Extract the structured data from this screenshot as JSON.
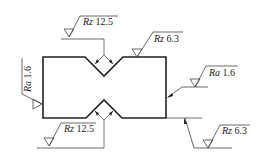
{
  "figure": {
    "type": "surface roughness drawing",
    "symbols": [
      {
        "id": "top-left",
        "param": "Rz",
        "value": "12.5"
      },
      {
        "id": "top-right",
        "param": "Rz",
        "value": "6.3"
      },
      {
        "id": "right-side",
        "param": "Ra",
        "value": "1.6"
      },
      {
        "id": "left-side",
        "param": "Ra",
        "value": "1.6"
      },
      {
        "id": "bottom-left",
        "param": "Rz",
        "value": "12.5"
      },
      {
        "id": "bottom-right",
        "param": "Rz",
        "value": "6.3"
      }
    ]
  },
  "colors": {
    "line": "#222222",
    "thin": "#555555"
  }
}
